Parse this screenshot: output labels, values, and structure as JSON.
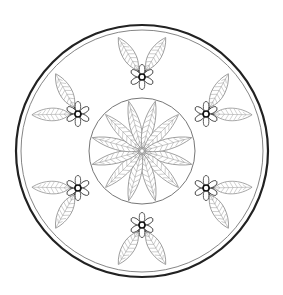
{
  "image": {
    "kind": "mandala line-art coloring page",
    "width": 283,
    "height": 295,
    "background": "#ffffff"
  },
  "colors": {
    "outer_ring": "#222222",
    "inner_ring": "#777777",
    "center_circle": "#666666",
    "flower_outline": "#333333",
    "leaf_outline": "#808080",
    "leaf_vein": "#9a9a9a"
  },
  "mandala": {
    "center": [
      142,
      151
    ],
    "outer_ring": {
      "radius": 126,
      "stroke_width": 2.2
    },
    "inner_ring": {
      "radius": 121,
      "stroke_width": 0.9
    },
    "center_circle": {
      "radius": 53,
      "stroke_width": 0.9
    },
    "central_rosette": {
      "leaf_count": 12,
      "start_angle_deg": 15,
      "leaf_length": 49,
      "leaf_width": 12,
      "veins": 7,
      "hub_radius": 2.2
    },
    "satellite_flowers": {
      "count": 6,
      "start_angle_deg": -90,
      "distance": 74,
      "petal_count": 6,
      "petal_length": 10,
      "petal_width": 5.5,
      "eye_radius": 3,
      "leaves": {
        "per_flower": 2,
        "spread_deg": 31,
        "offset": 8,
        "length": 38,
        "width": 14,
        "veins": 7
      }
    }
  }
}
